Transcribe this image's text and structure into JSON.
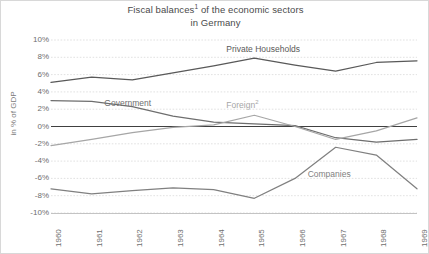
{
  "chart_data": {
    "type": "line",
    "title_line1": "Fiscal balances",
    "title_sup1": "1",
    "title_line1_rest": " of the economic sectors",
    "title_line2": "in Germany",
    "xlabel": "",
    "ylabel": "in % of GDP",
    "x": [
      1960,
      1961,
      1962,
      1963,
      1964,
      1965,
      1966,
      1967,
      1968,
      1969
    ],
    "categories": [
      "1960",
      "1961",
      "1962",
      "1963",
      "1964",
      "1965",
      "1966",
      "1967",
      "1968",
      "1969"
    ],
    "ylim": [
      -10,
      10
    ],
    "yticks": [
      10,
      8,
      6,
      4,
      2,
      0,
      -2,
      -4,
      -6,
      -8,
      -10
    ],
    "ytick_labels": [
      "10%",
      "8%",
      "6%",
      "4%",
      "2%",
      "0%",
      "-2%",
      "-4%",
      "-6%",
      "-8%",
      "-10%"
    ],
    "grid": true,
    "legend": "inline-labels",
    "zero_line": true,
    "series": [
      {
        "name": "Private Households",
        "color": "#595959",
        "values": [
          5.1,
          5.7,
          5.4,
          6.2,
          7.0,
          7.9,
          7.1,
          6.4,
          7.4,
          7.6
        ]
      },
      {
        "name": "Government",
        "color": "#6e6e6e",
        "values": [
          3.0,
          2.9,
          2.3,
          1.2,
          0.5,
          0.3,
          0.1,
          -1.3,
          -1.8,
          -1.5
        ]
      },
      {
        "name": "Foreign",
        "superscript": "2",
        "color": "#a6a6a6",
        "values": [
          -2.2,
          -1.5,
          -0.7,
          -0.1,
          0.2,
          1.3,
          0.0,
          -1.5,
          -0.5,
          1.0
        ]
      },
      {
        "name": "Companies",
        "color": "#808080",
        "values": [
          -7.2,
          -7.8,
          -7.4,
          -7.1,
          -7.3,
          -8.3,
          -6.0,
          -2.4,
          -3.3,
          -7.2
        ]
      }
    ],
    "annotations": [
      {
        "text": "Private Households",
        "x": 1965,
        "y": 8.9
      },
      {
        "text": "Government",
        "x": 1962,
        "y": 2.6
      },
      {
        "text": "Foreign",
        "superscript": "2",
        "x": 1965,
        "y": 2.4
      },
      {
        "text": "Companies",
        "x": 1967,
        "y": -5.6
      }
    ]
  },
  "colors": {
    "grid": "#d9d9d9",
    "axis": "#404040",
    "border": "#d8d8d8",
    "tick_text": "#6e6e6e",
    "title_text": "#4a4a4a"
  }
}
